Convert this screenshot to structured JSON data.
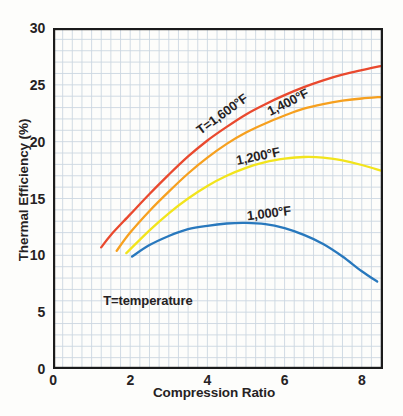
{
  "figure": {
    "background": "#fdfdfb",
    "text_color": "#262223",
    "frame_color": "#1b1b1b"
  },
  "chart_data": {
    "type": "line",
    "title": "",
    "xlabel": "Compression Ratio",
    "ylabel": "Thermal Efficiency  (%)",
    "xlim": [
      0,
      8.55
    ],
    "ylim": [
      0,
      30
    ],
    "xticks": [
      0,
      2,
      4,
      6,
      8
    ],
    "yticks": [
      0,
      5,
      10,
      15,
      20,
      25,
      30
    ],
    "grid": {
      "show": true,
      "x_minor_step": 0.25,
      "y_minor_step": 1,
      "color": "#ccd7e1"
    },
    "annotation": {
      "text": "T=temperature",
      "x": 1.3,
      "y": 6.1
    },
    "legend": "inline curve labels",
    "series": [
      {
        "id": "curve-1600f",
        "name": "T=1,600°F",
        "color": "#e9492e",
        "x": [
          1.25,
          1.5,
          2,
          2.5,
          3,
          3.5,
          4,
          4.5,
          5,
          5.5,
          6,
          6.5,
          7,
          7.5,
          8,
          8.55
        ],
        "y": [
          10.7,
          11.8,
          13.6,
          15.4,
          17.1,
          18.7,
          20.1,
          21.3,
          22.4,
          23.3,
          24.1,
          24.8,
          25.4,
          25.9,
          26.3,
          26.7
        ],
        "label": {
          "text": "T=1,600°F",
          "x": 4.38,
          "y": 22.4,
          "rotation": -36
        }
      },
      {
        "id": "curve-1400f",
        "name": "1,400°F",
        "color": "#f6a01f",
        "x": [
          1.65,
          2,
          2.5,
          3,
          3.5,
          4,
          4.5,
          5,
          5.5,
          6,
          6.5,
          7,
          7.5,
          8,
          8.55
        ],
        "y": [
          10.4,
          12.0,
          13.9,
          15.6,
          17.2,
          18.6,
          19.8,
          20.8,
          21.6,
          22.3,
          22.9,
          23.3,
          23.6,
          23.8,
          23.95
        ],
        "label": {
          "text": "1,400°F",
          "x": 6.09,
          "y": 23.5,
          "rotation": -27
        }
      },
      {
        "id": "curve-1200f",
        "name": "1,200°F",
        "color": "#f2e41c",
        "x": [
          1.9,
          2.5,
          3,
          3.5,
          4,
          4.5,
          5,
          5.5,
          6,
          6.5,
          7,
          7.5,
          8,
          8.55
        ],
        "y": [
          10.2,
          12.2,
          13.7,
          15.0,
          16.1,
          17.0,
          17.7,
          18.2,
          18.5,
          18.65,
          18.6,
          18.35,
          17.95,
          17.4
        ],
        "label": {
          "text": "1,200°F",
          "x": 5.31,
          "y": 18.7,
          "rotation": -12
        }
      },
      {
        "id": "curve-1000f",
        "name": "1,000°F",
        "color": "#2878bd",
        "x": [
          2.05,
          2.5,
          3,
          3.5,
          4,
          4.5,
          5,
          5.5,
          6,
          6.5,
          7,
          7.5,
          8,
          8.4
        ],
        "y": [
          9.9,
          10.9,
          11.7,
          12.3,
          12.6,
          12.8,
          12.85,
          12.75,
          12.4,
          11.8,
          11.0,
          9.9,
          8.6,
          7.7
        ],
        "label": {
          "text": "1,000°F",
          "x": 5.6,
          "y": 13.7,
          "rotation": -7
        }
      }
    ]
  }
}
